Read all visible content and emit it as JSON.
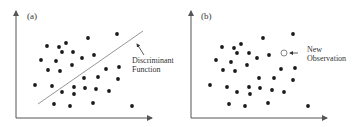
{
  "colors": {
    "axis": "#555555",
    "dot": "#1a1a1a",
    "line": "#8a8a8a",
    "text": "#333333",
    "open_circle": "#777777"
  },
  "panels": [
    {
      "id": "a",
      "label": "(a)",
      "label_pos": [
        27,
        19
      ],
      "axis": {
        "origin": [
          16,
          118
        ],
        "top_y": 11,
        "right_x": 152
      },
      "dots": [
        [
          47,
          46
        ],
        [
          59,
          47
        ],
        [
          66,
          43
        ],
        [
          88,
          38
        ],
        [
          117,
          34
        ],
        [
          62,
          52
        ],
        [
          73,
          52
        ],
        [
          94,
          55
        ],
        [
          41,
          60
        ],
        [
          56,
          61
        ],
        [
          82,
          58
        ],
        [
          72,
          65
        ],
        [
          48,
          70
        ],
        [
          60,
          71
        ],
        [
          106,
          69
        ],
        [
          119,
          67
        ],
        [
          84,
          78
        ],
        [
          98,
          77
        ],
        [
          118,
          79
        ],
        [
          35,
          85
        ],
        [
          52,
          86
        ],
        [
          74,
          87
        ],
        [
          85,
          88
        ],
        [
          96,
          89
        ],
        [
          109,
          91
        ],
        [
          62,
          92
        ],
        [
          74,
          94
        ],
        [
          54,
          104
        ],
        [
          70,
          106
        ],
        [
          93,
          103
        ],
        [
          132,
          106
        ]
      ],
      "discriminant_line": {
        "x1": 38,
        "y1": 104,
        "x2": 143,
        "y2": 31
      },
      "annotation": {
        "lines": [
          "Discriminant",
          "Function"
        ],
        "text_pos": [
          132,
          63
        ],
        "line_height": 9,
        "arrow": {
          "from": [
            144,
            55
          ],
          "to": [
            137,
            44
          ]
        }
      }
    },
    {
      "id": "b",
      "label": "(b)",
      "label_pos": [
        201,
        19
      ],
      "axis": {
        "origin": [
          191,
          118
        ],
        "top_y": 11,
        "right_x": 327
      },
      "dots": [
        [
          222,
          47
        ],
        [
          234,
          48
        ],
        [
          241,
          44
        ],
        [
          263,
          38
        ],
        [
          293,
          34
        ],
        [
          237,
          53
        ],
        [
          249,
          53
        ],
        [
          269,
          55
        ],
        [
          216,
          60
        ],
        [
          231,
          62
        ],
        [
          257,
          58
        ],
        [
          247,
          65
        ],
        [
          223,
          70
        ],
        [
          235,
          71
        ],
        [
          281,
          69
        ],
        [
          295,
          68
        ],
        [
          259,
          78
        ],
        [
          274,
          78
        ],
        [
          293,
          80
        ],
        [
          210,
          85
        ],
        [
          227,
          87
        ],
        [
          249,
          87
        ],
        [
          260,
          88
        ],
        [
          272,
          90
        ],
        [
          284,
          92
        ],
        [
          237,
          92
        ],
        [
          250,
          94
        ],
        [
          229,
          104
        ],
        [
          245,
          106
        ],
        [
          268,
          103
        ],
        [
          308,
          106
        ]
      ],
      "new_observation": {
        "pos": [
          284,
          53
        ],
        "r": 3
      },
      "annotation": {
        "lines": [
          "New",
          "Observation"
        ],
        "text_pos": [
          307,
          52
        ],
        "line_height": 9,
        "arrow": {
          "from": [
            298,
            53
          ],
          "to": [
            290,
            53
          ]
        }
      }
    }
  ]
}
